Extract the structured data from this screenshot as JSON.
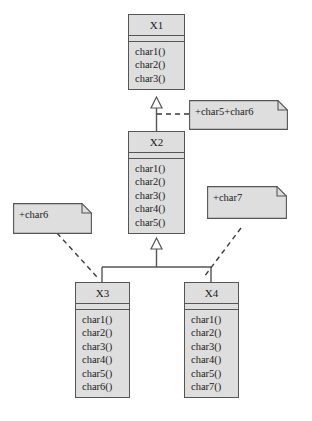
{
  "diagram": {
    "type": "uml-class-diagram",
    "background_color": "#ffffff",
    "fill_color": "#dedede",
    "stroke_color": "#555555",
    "text_color": "#1a1a1a",
    "classes": [
      {
        "id": "x1",
        "name": "X1",
        "attributes": [],
        "operations": [
          "char1()",
          "char2()",
          "char3()"
        ]
      },
      {
        "id": "x2",
        "name": "X2",
        "attributes": [],
        "operations": [
          "char1()",
          "char2()",
          "char3()",
          "char4()",
          "char5()"
        ]
      },
      {
        "id": "x3",
        "name": "X3",
        "attributes": [],
        "operations": [
          "char1()",
          "char2()",
          "char3()",
          "char4()",
          "char5()",
          "char6()"
        ]
      },
      {
        "id": "x4",
        "name": "X4",
        "attributes": [],
        "operations": [
          "char1()",
          "char2()",
          "char3()",
          "char4()",
          "char5()",
          "char7()"
        ]
      }
    ],
    "notes": [
      {
        "id": "note-char5-char6",
        "text": "+char5+char6",
        "attached_to": "x2"
      },
      {
        "id": "note-char6",
        "text": "+char6",
        "attached_to": "x3"
      },
      {
        "id": "note-char7",
        "text": "+char7",
        "attached_to": "x4"
      }
    ],
    "relations": [
      {
        "type": "generalization",
        "from": "x2",
        "to": "x1"
      },
      {
        "type": "generalization",
        "from": "x3",
        "to": "x2"
      },
      {
        "type": "generalization",
        "from": "x4",
        "to": "x2"
      },
      {
        "type": "note-link",
        "from": "note-char5-char6",
        "to": "x2"
      },
      {
        "type": "note-link",
        "from": "note-char6",
        "to": "x3"
      },
      {
        "type": "note-link",
        "from": "note-char7",
        "to": "x4"
      }
    ]
  }
}
